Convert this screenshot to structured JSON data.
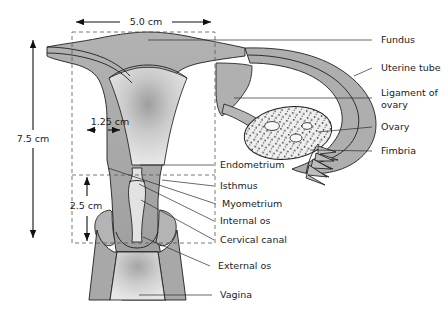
{
  "figure": {
    "background_color": "#ffffff",
    "outline_color": "#1f1f1f",
    "tissue_fill_color": "#a8a8a8",
    "lumen_fill_color": "#d9d9d9",
    "ovary_fill_color": "#ededed"
  },
  "dimensions": [
    {
      "id": "width-5cm",
      "label": "5.0 cm",
      "value": 5.0,
      "unit": "cm",
      "orientation": "horizontal",
      "measures": "fundus width"
    },
    {
      "id": "height-7-5cm",
      "label": "7.5 cm",
      "value": 7.5,
      "unit": "cm",
      "orientation": "vertical",
      "measures": "total uterine height"
    },
    {
      "id": "cavity-1-25cm",
      "label": "1.25 cm",
      "value": 1.25,
      "unit": "cm",
      "orientation": "horizontal",
      "measures": "myometrium wall thickness"
    },
    {
      "id": "cervix-2-5cm",
      "label": "2.5 cm",
      "value": 2.5,
      "unit": "cm",
      "orientation": "vertical",
      "measures": "cervix length"
    }
  ],
  "labels": {
    "right_column": [
      {
        "id": "fundus",
        "text": "Fundus"
      },
      {
        "id": "uterine-tube",
        "text": "Uterine tube"
      },
      {
        "id": "ligament-of-ovary-line1",
        "text": "Ligament of"
      },
      {
        "id": "ligament-of-ovary-line2",
        "text": "ovary"
      },
      {
        "id": "ovary",
        "text": "Ovary"
      },
      {
        "id": "fimbria",
        "text": "Fimbria"
      }
    ],
    "center_column": [
      {
        "id": "endometrium",
        "text": "Endometrium"
      },
      {
        "id": "isthmus",
        "text": "Isthmus"
      },
      {
        "id": "myometrium",
        "text": "Myometrium"
      },
      {
        "id": "internal-os",
        "text": "Internal os"
      },
      {
        "id": "cervical-canal",
        "text": "Cervical canal"
      },
      {
        "id": "external-os",
        "text": "External os"
      },
      {
        "id": "vagina",
        "text": "Vagina"
      }
    ]
  }
}
